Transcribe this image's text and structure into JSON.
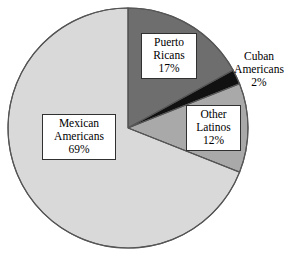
{
  "chart_data": {
    "type": "pie",
    "title": "",
    "subtitle": "",
    "xlabel": "",
    "ylabel": "",
    "legend": "none",
    "grid": false,
    "start_angle_clock": "12 o'clock",
    "direction": "clockwise",
    "categories": [
      "Puerto Ricans",
      "Cuban Americans",
      "Other Latinos",
      "Mexican Americans"
    ],
    "values": [
      17,
      2,
      12,
      69
    ],
    "unit": "%",
    "slices": [
      {
        "name": "puerto-ricans",
        "label_line1": "Puerto",
        "label_line2": "Ricans",
        "value_text": "17%",
        "value": 17,
        "color": "#6e6e6e",
        "label_style": "boxed-inside"
      },
      {
        "name": "cuban-americans",
        "label_line1": "Cuban",
        "label_line2": "Americans",
        "value_text": "2%",
        "value": 2,
        "color": "#111111",
        "label_style": "plain-outside"
      },
      {
        "name": "other-latinos",
        "label_line1": "Other",
        "label_line2": "Latinos",
        "value_text": "12%",
        "value": 12,
        "color": "#a9a9a9",
        "label_style": "boxed-inside"
      },
      {
        "name": "mexican-americans",
        "label_line1": "Mexican",
        "label_line2": "Americans",
        "value_text": "69%",
        "value": 69,
        "color": "#d9d9d9",
        "label_style": "boxed-inside"
      }
    ],
    "outline_color": "#555555",
    "background_color": "#ffffff"
  }
}
